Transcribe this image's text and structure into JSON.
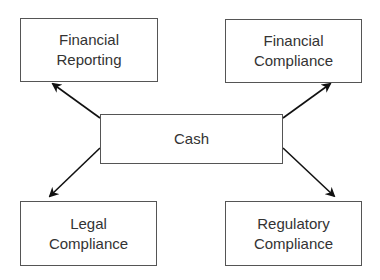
{
  "diagram": {
    "center": {
      "label": "Cash"
    },
    "nodes": [
      {
        "id": "financial-reporting",
        "line1": "Financial",
        "line2": "Reporting"
      },
      {
        "id": "financial-compliance",
        "line1": "Financial",
        "line2": "Compliance"
      },
      {
        "id": "legal-compliance",
        "line1": "Legal",
        "line2": "Compliance"
      },
      {
        "id": "regulatory-compliance",
        "line1": "Regulatory",
        "line2": "Compliance"
      }
    ],
    "edges": [
      {
        "from": "Cash",
        "to": "Financial Reporting"
      },
      {
        "from": "Cash",
        "to": "Financial Compliance"
      },
      {
        "from": "Cash",
        "to": "Legal Compliance"
      },
      {
        "from": "Cash",
        "to": "Regulatory Compliance"
      }
    ],
    "colors": {
      "stroke": "#555555",
      "arrow": "#111111",
      "text": "#333333",
      "background": "#ffffff"
    }
  }
}
